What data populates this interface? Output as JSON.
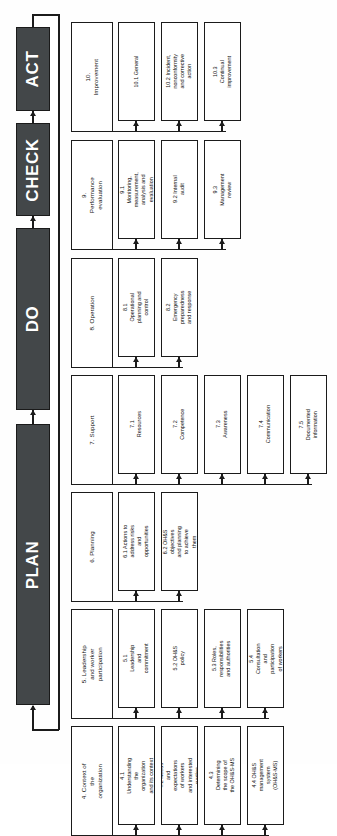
{
  "diagram": {
    "type": "flowchart",
    "orientation": "rotated-90-ccw",
    "colors": {
      "phase_bar_fill": "#434749",
      "phase_bar_text": "#ffffff",
      "box_fill": "#ffffff",
      "box_border": "#1b1b1b",
      "connector": "#1b1b1b"
    },
    "phases": [
      {
        "id": "plan",
        "label": "PLAN"
      },
      {
        "id": "do",
        "label": "DO"
      },
      {
        "id": "check",
        "label": "CHECK"
      },
      {
        "id": "act",
        "label": "ACT"
      }
    ],
    "sections": [
      {
        "id": "sec4",
        "phase": "plan",
        "label": "4. Context of the organization",
        "children": [
          {
            "id": "s4_1",
            "label": "4.1 Understanding the organization and its context"
          },
          {
            "id": "s4_2",
            "label": "4.2 Needs and expectations of workers and interested parties"
          },
          {
            "id": "s4_3",
            "label": "4.3 Determining the scope of the OH&S-MS"
          },
          {
            "id": "s4_4",
            "label": "4.4 OH&S management system (OH&S-MS)"
          }
        ]
      },
      {
        "id": "sec5",
        "phase": "plan",
        "label": "5. Leadership and worker participation",
        "children": [
          {
            "id": "s5_1",
            "label": "5.1 Leadership and commitment"
          },
          {
            "id": "s5_2",
            "label": "5.2 OH&S policy"
          },
          {
            "id": "s5_3",
            "label": "5.3 Roles, responsibilities and authorities"
          },
          {
            "id": "s5_4",
            "label": "5.4 Consultation and participation of workers"
          }
        ]
      },
      {
        "id": "sec6",
        "phase": "plan",
        "label": "6. Planning",
        "children": [
          {
            "id": "s6_1",
            "label": "6.1 Actions to address risks and opportunities"
          },
          {
            "id": "s6_2",
            "label": "6.2 OH&S objectives and planning to achieve them"
          }
        ]
      },
      {
        "id": "sec7",
        "phase": "do",
        "label": "7. Support",
        "children": [
          {
            "id": "s7_1",
            "label": "7.1 Resources"
          },
          {
            "id": "s7_2",
            "label": "7.2 Competence"
          },
          {
            "id": "s7_3",
            "label": "7.3 Awareness"
          },
          {
            "id": "s7_4",
            "label": "7.4 Communication"
          },
          {
            "id": "s7_5",
            "label": "7.5 Documented information"
          }
        ]
      },
      {
        "id": "sec8",
        "phase": "do",
        "label": "8. Operation",
        "children": [
          {
            "id": "s8_1",
            "label": "8.1 Operational planning and control"
          },
          {
            "id": "s8_2",
            "label": "8.2 Emergency preparedness and response"
          }
        ]
      },
      {
        "id": "sec9",
        "phase": "check",
        "label": "9. Performance evaluation",
        "children": [
          {
            "id": "s9_1",
            "label": "9.1 Monitoring, measurement, analysis and evaluation"
          },
          {
            "id": "s9_2",
            "label": "9.2 Internal audit"
          },
          {
            "id": "s9_3",
            "label": "9.3 Management review"
          }
        ]
      },
      {
        "id": "sec10",
        "phase": "act",
        "label": "10. Improvement",
        "children": [
          {
            "id": "s10_1",
            "label": "10.1 General"
          },
          {
            "id": "s10_2",
            "label": "10.2 Incident, nonconformity and corrective action"
          },
          {
            "id": "s10_3",
            "label": "10.3 Continual improvement"
          }
        ]
      }
    ]
  }
}
